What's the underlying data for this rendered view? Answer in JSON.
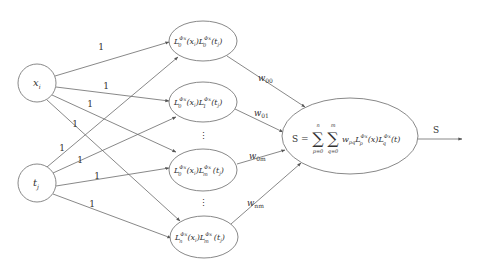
{
  "diagram": {
    "type": "neural-network",
    "input_nodes": [
      {
        "id": "x",
        "label": "x",
        "sub": "i",
        "cx": 37,
        "cy": 83,
        "r": 19
      },
      {
        "id": "t",
        "label": "t",
        "sub": "j",
        "cx": 37,
        "cy": 183,
        "r": 19
      }
    ],
    "hidden_nodes": [
      {
        "id": "h00",
        "L1_sub": "0",
        "L2_sub": "0",
        "cx": 203,
        "cy": 41,
        "rx": 34,
        "ry": 20
      },
      {
        "id": "h01",
        "L1_sub": "0",
        "L2_sub": "1",
        "cx": 203,
        "cy": 102,
        "rx": 34,
        "ry": 20
      },
      {
        "id": "h0m",
        "L1_sub": "0",
        "L2_sub": "m",
        "cx": 203,
        "cy": 170,
        "rx": 34,
        "ry": 21
      },
      {
        "id": "hnm",
        "L1_sub": "n",
        "L2_sub": "m",
        "cx": 204,
        "cy": 237,
        "rx": 34,
        "ry": 21
      }
    ],
    "hidden_term": {
      "L": "L",
      "sup": "Φx",
      "arg1": "(x",
      "arg1_sub": "i",
      "arg1_close": ")",
      "arg2": "(t",
      "arg2_sub": "j",
      "arg2_close": ")"
    },
    "ellipsis": "⋮",
    "output_node": {
      "cx": 350,
      "cy": 136,
      "rx": 68,
      "ry": 38,
      "formula": {
        "lhs": "S =",
        "sum1_top": "n",
        "sum1_bottom": "p=0",
        "sum2_top": "m",
        "sum2_bottom": "q=0",
        "sigma": "∑",
        "w": "w",
        "w_sub": "pq",
        "L": "L",
        "L1_sub": "p",
        "L2_sub": "q",
        "sup": "Φx",
        "arg1": "(x)",
        "arg2": "(t)"
      }
    },
    "input_edge_label": "1",
    "input_edges": [
      {
        "x1": 55,
        "y1": 76,
        "x2": 169,
        "y2": 42,
        "lx": 101,
        "ly": 50
      },
      {
        "x1": 56,
        "y1": 87,
        "x2": 169,
        "y2": 101,
        "lx": 106,
        "ly": 89
      },
      {
        "x1": 52,
        "y1": 95,
        "x2": 176,
        "y2": 152,
        "lx": 90,
        "ly": 107
      },
      {
        "x1": 47,
        "y1": 100,
        "x2": 180,
        "y2": 221,
        "lx": 75,
        "ly": 127
      },
      {
        "x1": 47,
        "y1": 167,
        "x2": 178,
        "y2": 57,
        "lx": 62,
        "ly": 151
      },
      {
        "x1": 53,
        "y1": 173,
        "x2": 176,
        "y2": 117,
        "lx": 80,
        "ly": 163
      },
      {
        "x1": 56,
        "y1": 186,
        "x2": 169,
        "y2": 168,
        "lx": 97,
        "ly": 179
      },
      {
        "x1": 53,
        "y1": 194,
        "x2": 171,
        "y2": 238,
        "lx": 92,
        "ly": 207
      }
    ],
    "weight_edges": [
      {
        "label": "w",
        "sub": "00",
        "x1": 227,
        "y1": 56,
        "x2": 305,
        "y2": 107,
        "lx": 258,
        "ly": 81
      },
      {
        "label": "w",
        "sub": "01",
        "x1": 235,
        "y1": 109,
        "x2": 283,
        "y2": 132,
        "lx": 254,
        "ly": 116
      },
      {
        "label": "w",
        "sub": "0m",
        "x1": 237,
        "y1": 164,
        "x2": 285,
        "y2": 150,
        "lx": 249,
        "ly": 159
      },
      {
        "label": "w",
        "sub": "nm",
        "x1": 231,
        "y1": 224,
        "x2": 301,
        "y2": 163,
        "lx": 247,
        "ly": 206
      }
    ],
    "output_edge": {
      "x1": 418,
      "y1": 139,
      "x2": 462,
      "y2": 139,
      "label": "S",
      "lx": 436,
      "ly": 133
    },
    "colors": {
      "stroke": "#7a7a7a",
      "edge": "#6a6a6a",
      "text": "#333333",
      "background": "#ffffff"
    }
  }
}
